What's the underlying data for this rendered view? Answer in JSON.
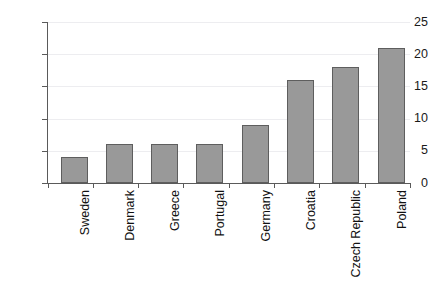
{
  "chart_data": {
    "type": "bar",
    "title": "",
    "subtitle": "",
    "xlabel": "",
    "ylabel": "",
    "categories": [
      "Sweden",
      "Denmark",
      "Greece",
      "Portugal",
      "Germany",
      "Croatia",
      "Czech Republic",
      "Poland"
    ],
    "values": [
      4,
      6,
      6,
      6,
      9,
      16,
      18,
      21
    ],
    "ylim": [
      0,
      25
    ],
    "ytick_labels": [
      "0",
      "5",
      "10",
      "15",
      "20",
      "25"
    ],
    "ytick_values": [
      0,
      5,
      10,
      15,
      20,
      25
    ],
    "grid": true,
    "legend": false,
    "legend_position": "none",
    "bar_color": "#999999",
    "bar_border_color": "#5e5e5e",
    "gridline_color": "#ededf0",
    "axis_color": "#5a5a5a",
    "text_color": "#111111",
    "background_color": "#ffffff",
    "xlabel_rotation": 90
  }
}
